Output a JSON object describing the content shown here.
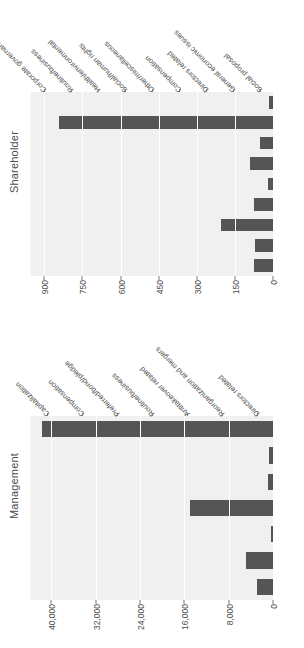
{
  "figure": {
    "orientation": "rotated-90-ccw",
    "bar_color": "#555555",
    "panel_bg": "#f0f0f0",
    "grid_color": "#ffffff",
    "text_color": "#4d4d4d"
  },
  "panels": [
    {
      "title": "Management",
      "axis_ticks": [
        "0",
        "8,000",
        "16,000",
        "24,000",
        "32,000",
        "40,000"
      ],
      "axis_tick_values": [
        0,
        8000,
        16000,
        24000,
        32000,
        40000
      ],
      "axis_max": 44000,
      "categories": [
        "Capitalization",
        "Compensation",
        "Preferred/bond/pledge",
        "Routine/business",
        "Antitakeover related",
        "Reorganization and mergers",
        "Directors related"
      ],
      "values": [
        3000,
        5100,
        600,
        15200,
        1100,
        900,
        41800
      ]
    },
    {
      "title": "Shareholder",
      "axis_ticks": [
        "0",
        "150",
        "300",
        "450",
        "600",
        "750",
        "900"
      ],
      "axis_tick_values": [
        0,
        150,
        300,
        450,
        600,
        750,
        900
      ],
      "axis_max": 960,
      "categories": [
        "Corporate governance",
        "Routine/business",
        "Health/environmental",
        "Social/human rights",
        "Other/miscellaneous",
        "Compensation",
        "Directors related",
        "General economic issues",
        "Social proposal"
      ],
      "values": [
        80,
        75,
        210,
        78,
        22,
        95,
        55,
        845,
        18
      ]
    }
  ],
  "chart_data": {
    "type": "bar",
    "title": "",
    "xlabel": "",
    "ylabel": "",
    "grid": true,
    "legend": "none",
    "orientation": "horizontal",
    "panels": [
      {
        "name": "Shareholder",
        "categories": [
          "Corporate governance",
          "Routine/business",
          "Health/environmental",
          "Social/human rights",
          "Other/miscellaneous",
          "Compensation",
          "Directors related",
          "General economic issues",
          "Social proposal"
        ],
        "values": [
          80,
          75,
          210,
          78,
          22,
          95,
          55,
          845,
          18
        ],
        "xlim": [
          0,
          960
        ],
        "xticks": [
          0,
          150,
          300,
          450,
          600,
          750,
          900
        ]
      },
      {
        "name": "Management",
        "categories": [
          "Capitalization",
          "Compensation",
          "Preferred/bond/pledge",
          "Routine/business",
          "Antitakeover related",
          "Reorganization and mergers",
          "Directors related"
        ],
        "values": [
          3000,
          5100,
          600,
          15200,
          1100,
          900,
          41800
        ],
        "xlim": [
          0,
          44000
        ],
        "xticks": [
          0,
          8000,
          16000,
          24000,
          32000,
          40000
        ]
      }
    ]
  }
}
